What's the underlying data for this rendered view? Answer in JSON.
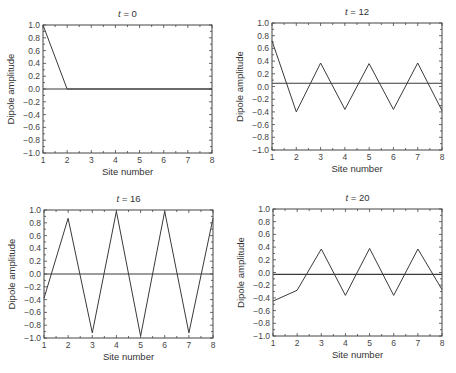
{
  "chart_data": [
    {
      "type": "line",
      "title": "t = 0",
      "title_var": "t",
      "title_value": "0",
      "xlabel": "Site number",
      "ylabel": "Dipole amplitude",
      "x": [
        1,
        2,
        3,
        4,
        5,
        6,
        7,
        8
      ],
      "series": [
        {
          "name": "dipole",
          "values": [
            1.0,
            0.0,
            0.0,
            0.0,
            0.0,
            0.0,
            0.0,
            0.0
          ]
        },
        {
          "name": "baseline",
          "values": [
            0.0,
            0.0,
            0.0,
            0.0,
            0.0,
            0.0,
            0.0,
            0.0
          ]
        }
      ],
      "xlim": [
        1,
        8
      ],
      "ylim": [
        -1.0,
        1.0
      ],
      "xticks": [
        "1",
        "2",
        "3",
        "4",
        "5",
        "6",
        "7",
        "8"
      ],
      "yticks": [
        "1.0",
        "0.8",
        "0.6",
        "0.4",
        "0.2",
        "0.0",
        "-0.2",
        "-0.4",
        "-0.6",
        "-0.8",
        "-1.0"
      ],
      "grid": false,
      "legend": "none",
      "box": {
        "left": 43,
        "top": 25,
        "right": 212,
        "bottom": 153
      }
    },
    {
      "type": "line",
      "title": "t = 12",
      "title_var": "t",
      "title_value": "12",
      "xlabel": "Site number",
      "ylabel": "Dipole amplitude",
      "x": [
        1,
        2,
        3,
        4,
        5,
        6,
        7,
        8
      ],
      "series": [
        {
          "name": "dipole",
          "values": [
            0.72,
            -0.4,
            0.37,
            -0.36,
            0.36,
            -0.36,
            0.37,
            -0.38
          ]
        },
        {
          "name": "baseline",
          "values": [
            0.05,
            0.05,
            0.05,
            0.05,
            0.05,
            0.05,
            0.05,
            0.05
          ]
        }
      ],
      "xlim": [
        1,
        8
      ],
      "ylim": [
        -1.0,
        1.0
      ],
      "xticks": [
        "1",
        "2",
        "3",
        "4",
        "5",
        "6",
        "7",
        "8"
      ],
      "yticks": [
        "1.0",
        "0.8",
        "0.6",
        "0.4",
        "0.2",
        "0.0",
        "-0.2",
        "-0.4",
        "-0.6",
        "-0.8",
        "-1.0"
      ],
      "grid": false,
      "legend": "none",
      "box": {
        "left": 272,
        "top": 23,
        "right": 442,
        "bottom": 150
      }
    },
    {
      "type": "line",
      "title": "t = 16",
      "title_var": "t",
      "title_value": "16",
      "xlabel": "Site number",
      "ylabel": "Dipole amplitude",
      "x": [
        1,
        2,
        3,
        4,
        5,
        6,
        7,
        8
      ],
      "series": [
        {
          "name": "dipole",
          "values": [
            -0.38,
            0.87,
            -0.92,
            0.98,
            -0.97,
            0.98,
            -0.92,
            0.87
          ]
        },
        {
          "name": "baseline",
          "values": [
            0.0,
            0.0,
            0.0,
            0.0,
            0.0,
            0.0,
            0.0,
            0.0
          ]
        }
      ],
      "xlim": [
        1,
        8
      ],
      "ylim": [
        -1.0,
        1.0
      ],
      "xticks": [
        "1",
        "2",
        "3",
        "4",
        "5",
        "6",
        "7",
        "8"
      ],
      "yticks": [
        "1.0",
        "0.8",
        "0.6",
        "0.4",
        "0.2",
        "0.0",
        "-0.2",
        "-0.4",
        "-0.6",
        "-0.8",
        "-1.0"
      ],
      "grid": false,
      "legend": "none",
      "box": {
        "left": 44,
        "top": 210,
        "right": 213,
        "bottom": 338
      }
    },
    {
      "type": "line",
      "title": "t = 20",
      "title_var": "t",
      "title_value": "20",
      "xlabel": "Site number",
      "ylabel": "Dipole amplitude",
      "x": [
        1,
        2,
        3,
        4,
        5,
        6,
        7,
        8
      ],
      "series": [
        {
          "name": "dipole",
          "values": [
            -0.45,
            -0.28,
            0.37,
            -0.36,
            0.38,
            -0.36,
            0.37,
            -0.27
          ]
        },
        {
          "name": "baseline",
          "values": [
            -0.03,
            -0.03,
            -0.03,
            -0.03,
            -0.03,
            -0.03,
            -0.03,
            -0.03
          ]
        }
      ],
      "xlim": [
        1,
        8
      ],
      "ylim": [
        -1.0,
        1.0
      ],
      "xticks": [
        "1",
        "2",
        "3",
        "4",
        "5",
        "6",
        "7",
        "8"
      ],
      "yticks": [
        "1.0",
        "0.8",
        "0.6",
        "0.4",
        "0.2",
        "0.0",
        "-0.2",
        "-0.4",
        "-0.6",
        "-0.8",
        "-1.0"
      ],
      "grid": false,
      "legend": "none",
      "box": {
        "left": 273,
        "top": 209,
        "right": 442,
        "bottom": 336
      }
    }
  ],
  "colors": {
    "line": "#3a3a3a",
    "axis": "#444444",
    "text": "#333333",
    "background": "#ffffff"
  }
}
